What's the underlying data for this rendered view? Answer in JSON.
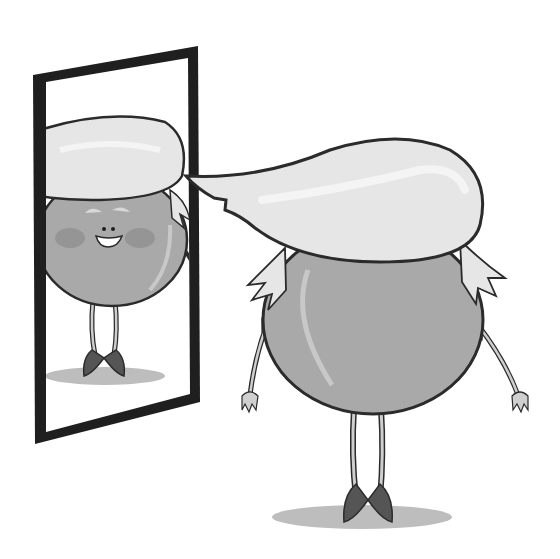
{
  "scene": {
    "alt": "Cartoon of a round gray character with swooping light hair looking into a tall mirror, whose reflection smiles back",
    "colors": {
      "background": "#ffffff",
      "outline": "#2b2b2b",
      "body": "#a9a9a9",
      "body_highlight": "#c8c8c8",
      "hair": "#e6e6e6",
      "hair_highlight": "#f4f4f4",
      "mirror_frame": "#1f1f1f",
      "mirror_glass": "#ffffff",
      "shadow": "#bdbdbd",
      "cheek": "#959595",
      "shoe": "#555555",
      "limb": "#cfcfcf"
    },
    "elements": [
      "mirror",
      "reflection-character",
      "main-character",
      "floor-shadow"
    ]
  }
}
